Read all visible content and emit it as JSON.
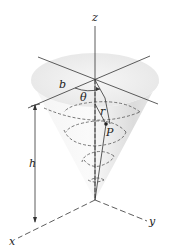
{
  "figure": {
    "labels": {
      "z": "z",
      "x": "x",
      "y": "y",
      "b": "b",
      "theta": "θ",
      "r": "r",
      "P": "P",
      "h": "h"
    },
    "colors": {
      "line": "#333333",
      "cone_fill": "#ececec",
      "cone_shade": "#d6d6d6",
      "background": "#ffffff"
    }
  }
}
